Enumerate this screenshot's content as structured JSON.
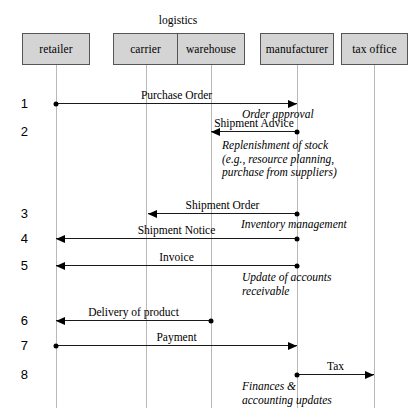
{
  "diagram": {
    "group_label": "logistics",
    "actors": [
      {
        "id": "retailer",
        "label": "retailer",
        "x": 22,
        "y": 33,
        "w": 68,
        "h": 32,
        "lifeline_x": 56
      },
      {
        "id": "carrier",
        "label": "carrier",
        "x": 113,
        "y": 33,
        "w": 65,
        "h": 32,
        "lifeline_x": 146
      },
      {
        "id": "warehouse",
        "label": "warehouse",
        "x": 178,
        "y": 33,
        "w": 67,
        "h": 32,
        "lifeline_x": 211
      },
      {
        "id": "manufacturer",
        "label": "manufacturer",
        "x": 260,
        "y": 33,
        "w": 74,
        "h": 32,
        "lifeline_x": 297
      },
      {
        "id": "tax-office",
        "label": "tax office",
        "x": 341,
        "y": 33,
        "w": 67,
        "h": 32,
        "lifeline_x": 374
      }
    ],
    "steps": [
      {
        "num": "1",
        "y": 103
      },
      {
        "num": "2",
        "y": 131
      },
      {
        "num": "3",
        "y": 213
      },
      {
        "num": "4",
        "y": 238
      },
      {
        "num": "5",
        "y": 265
      },
      {
        "num": "6",
        "y": 320
      },
      {
        "num": "7",
        "y": 345
      },
      {
        "num": "8",
        "y": 374
      }
    ],
    "messages": [
      {
        "id": "purchase-order",
        "label": "Purchase Order",
        "from": "retailer",
        "to": "manufacturer",
        "y": 103,
        "x1": 56,
        "x2": 297,
        "dir": "right"
      },
      {
        "id": "shipment-advice",
        "label": "Shipment Advice",
        "from": "manufacturer",
        "to": "warehouse",
        "y": 131,
        "x1": 297,
        "x2": 211,
        "dir": "left"
      },
      {
        "id": "shipment-order",
        "label": "Shipment Order",
        "from": "manufacturer",
        "to": "warehouse",
        "y": 213,
        "x1": 297,
        "x2": 148,
        "dir": "left"
      },
      {
        "id": "shipment-notice",
        "label": "Shipment Notice",
        "from": "manufacturer",
        "to": "retailer",
        "y": 238,
        "x1": 297,
        "x2": 56,
        "dir": "left"
      },
      {
        "id": "invoice",
        "label": "Invoice",
        "from": "manufacturer",
        "to": "retailer",
        "y": 265,
        "x1": 297,
        "x2": 56,
        "dir": "left"
      },
      {
        "id": "delivery-of-product",
        "label": "Delivery of product",
        "from": "warehouse",
        "to": "retailer",
        "y": 320,
        "x1": 211,
        "x2": 56,
        "dir": "left"
      },
      {
        "id": "payment",
        "label": "Payment",
        "from": "retailer",
        "to": "manufacturer",
        "y": 345,
        "x1": 56,
        "x2": 297,
        "dir": "right"
      },
      {
        "id": "tax",
        "label": "Tax",
        "from": "manufacturer",
        "to": "tax-office",
        "y": 374,
        "x1": 297,
        "x2": 374,
        "dir": "right"
      }
    ],
    "annotations": [
      {
        "id": "order-approval",
        "text": "Order approval",
        "x": 242,
        "y": 108
      },
      {
        "id": "replenishment-of-stock",
        "text": "Replenishment of stock\n(e.g., resource planning,\npurchase from suppliers)",
        "x": 222,
        "y": 139
      },
      {
        "id": "inventory-management",
        "text": "Inventory management",
        "x": 241,
        "y": 218
      },
      {
        "id": "update-of-accounts",
        "text": "Update of accounts\nreceivable",
        "x": 242,
        "y": 271
      },
      {
        "id": "finances-accounting",
        "text": "Finances &\naccounting updates",
        "x": 242,
        "y": 380
      }
    ]
  }
}
